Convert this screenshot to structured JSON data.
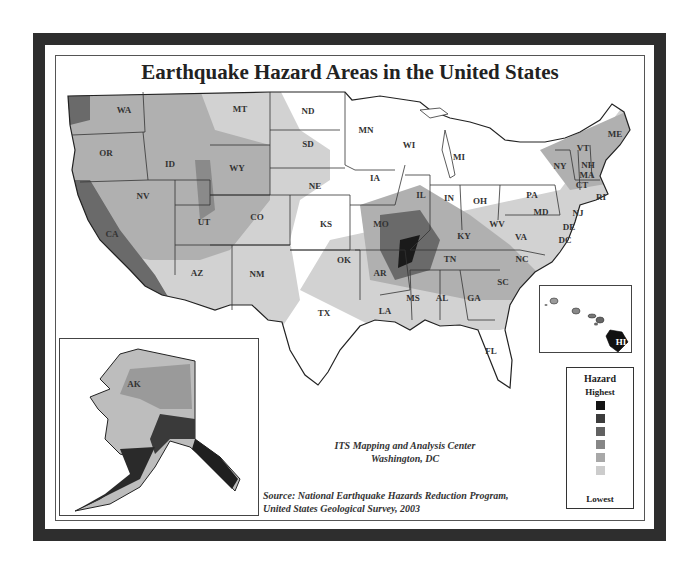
{
  "title": "Earthquake Hazard Areas in the United States",
  "legend": {
    "title": "Hazard",
    "highest_label": "Highest",
    "lowest_label": "Lowest",
    "swatches": [
      "#141414",
      "#3c3c3c",
      "#616161",
      "#868686",
      "#a8a8a8",
      "#cccccc"
    ]
  },
  "credits": {
    "producer_line1": "ITS Mapping and Analysis Center",
    "producer_line2": "Washington, DC",
    "source_line1": "Source: National Earthquake Hazards Reduction Program,",
    "source_line2": "United States Geological Survey, 2003"
  },
  "states": [
    {
      "code": "WA",
      "x": 124,
      "y": 113
    },
    {
      "code": "OR",
      "x": 106,
      "y": 156
    },
    {
      "code": "ID",
      "x": 170,
      "y": 167
    },
    {
      "code": "MT",
      "x": 240,
      "y": 112
    },
    {
      "code": "WY",
      "x": 237,
      "y": 171
    },
    {
      "code": "NV",
      "x": 143,
      "y": 199
    },
    {
      "code": "UT",
      "x": 204,
      "y": 225
    },
    {
      "code": "CO",
      "x": 257,
      "y": 220
    },
    {
      "code": "CA",
      "x": 112,
      "y": 237
    },
    {
      "code": "AZ",
      "x": 197,
      "y": 276
    },
    {
      "code": "NM",
      "x": 257,
      "y": 277
    },
    {
      "code": "ND",
      "x": 308,
      "y": 114
    },
    {
      "code": "SD",
      "x": 308,
      "y": 147
    },
    {
      "code": "NE",
      "x": 315,
      "y": 189
    },
    {
      "code": "KS",
      "x": 326,
      "y": 227
    },
    {
      "code": "OK",
      "x": 344,
      "y": 263
    },
    {
      "code": "TX",
      "x": 324,
      "y": 316
    },
    {
      "code": "MN",
      "x": 366,
      "y": 133
    },
    {
      "code": "IA",
      "x": 375,
      "y": 181
    },
    {
      "code": "MO",
      "x": 381,
      "y": 227
    },
    {
      "code": "AR",
      "x": 380,
      "y": 276
    },
    {
      "code": "LA",
      "x": 385,
      "y": 314
    },
    {
      "code": "WI",
      "x": 409,
      "y": 148
    },
    {
      "code": "IL",
      "x": 421,
      "y": 198
    },
    {
      "code": "MS",
      "x": 413,
      "y": 301
    },
    {
      "code": "MI",
      "x": 459,
      "y": 160
    },
    {
      "code": "IN",
      "x": 449,
      "y": 201
    },
    {
      "code": "OH",
      "x": 480,
      "y": 204
    },
    {
      "code": "KY",
      "x": 464,
      "y": 239
    },
    {
      "code": "TN",
      "x": 450,
      "y": 262
    },
    {
      "code": "AL",
      "x": 442,
      "y": 301
    },
    {
      "code": "GA",
      "x": 474,
      "y": 301
    },
    {
      "code": "FL",
      "x": 491,
      "y": 354
    },
    {
      "code": "SC",
      "x": 503,
      "y": 285
    },
    {
      "code": "NC",
      "x": 522,
      "y": 262
    },
    {
      "code": "VA",
      "x": 521,
      "y": 240
    },
    {
      "code": "WV",
      "x": 497,
      "y": 227
    },
    {
      "code": "PA",
      "x": 532,
      "y": 198
    },
    {
      "code": "NY",
      "x": 560,
      "y": 169
    },
    {
      "code": "VT",
      "x": 583,
      "y": 151
    },
    {
      "code": "NH",
      "x": 588,
      "y": 168
    },
    {
      "code": "ME",
      "x": 615,
      "y": 137
    },
    {
      "code": "MA",
      "x": 587,
      "y": 178
    },
    {
      "code": "CT",
      "x": 582,
      "y": 188
    },
    {
      "code": "RI",
      "x": 601,
      "y": 200
    },
    {
      "code": "NJ",
      "x": 578,
      "y": 216
    },
    {
      "code": "DE",
      "x": 569,
      "y": 230
    },
    {
      "code": "MD",
      "x": 541,
      "y": 215
    },
    {
      "code": "DC",
      "x": 565,
      "y": 243
    },
    {
      "code": "AK",
      "x": 133,
      "y": 386
    },
    {
      "code": "HI",
      "x": 620,
      "y": 328
    }
  ]
}
